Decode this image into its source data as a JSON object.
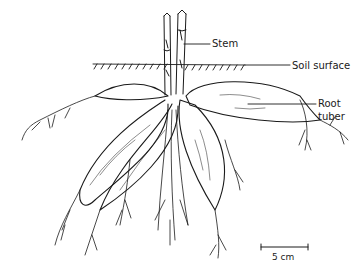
{
  "diagram": {
    "labels": {
      "stem": "Stem",
      "soil_surface": "Soil surface",
      "root_tuber_line1": "Root",
      "root_tuber_line2": "tuber"
    },
    "scale_bar": {
      "label": "5 cm"
    },
    "colors": {
      "ink": "#1a1a1a",
      "background": "#ffffff"
    }
  }
}
